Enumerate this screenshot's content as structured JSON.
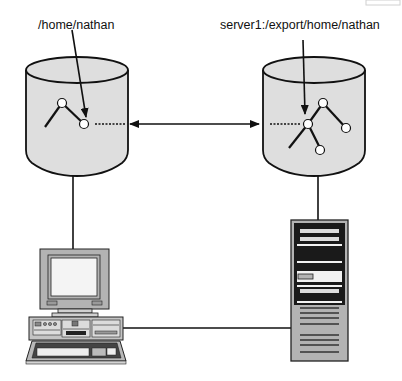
{
  "diagram": {
    "title": "",
    "labels": {
      "client_path": "/home/nathan",
      "server_path": "server1:/export/home/nathan"
    },
    "nodes": [
      {
        "id": "client-disk",
        "type": "cylinder",
        "label_ref": "client_path"
      },
      {
        "id": "server-disk",
        "type": "cylinder",
        "label_ref": "server_path"
      },
      {
        "id": "client-workstation",
        "type": "desktop-computer"
      },
      {
        "id": "server-tower",
        "type": "server-tower"
      }
    ],
    "edges": [
      {
        "from": "client-disk",
        "to": "server-disk",
        "style": "double-arrow"
      },
      {
        "from": "client-disk",
        "to": "client-workstation",
        "style": "line"
      },
      {
        "from": "server-disk",
        "to": "server-tower",
        "style": "line"
      },
      {
        "from": "client-workstation",
        "to": "server-tower",
        "style": "line"
      }
    ],
    "colors": {
      "cylinder_fill": "#dedede",
      "stroke": "#111111",
      "node_fill": "#ffffff",
      "device_gray": "#b3b3b3",
      "device_light": "#e6e6e6",
      "server_dark": "#1a1a1a"
    }
  }
}
